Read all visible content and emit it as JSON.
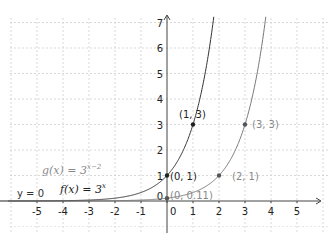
{
  "chart_data": {
    "type": "line",
    "title": "",
    "xlabel": "",
    "ylabel": "",
    "xlim": [
      -6,
      6
    ],
    "ylim": [
      -0.9,
      7.3
    ],
    "grid": true,
    "x_ticks": [
      -5,
      -4,
      -3,
      -2,
      -1,
      0,
      1,
      2,
      3,
      4,
      5
    ],
    "y_ticks": [
      0,
      1,
      2,
      3,
      4,
      5,
      6,
      7
    ],
    "series": [
      {
        "name": "f(x) = 3^x",
        "formula": "3^x",
        "color": "#333333",
        "points": [
          {
            "label": "(0, 1)",
            "x": 0,
            "y": 1
          },
          {
            "label": "(1, 3)",
            "x": 1,
            "y": 3
          }
        ]
      },
      {
        "name": "g(x) = 3^(x-2)",
        "formula": "3^(x-2)",
        "color": "#777777",
        "points": [
          {
            "label": "(0, 0.11)",
            "x": 0,
            "y": 0.11
          },
          {
            "label": "(2, 1)",
            "x": 2,
            "y": 1
          },
          {
            "label": "(3, 3)",
            "x": 3,
            "y": 3
          }
        ]
      }
    ],
    "asymptote": {
      "label": "y = 0",
      "y": 0
    },
    "legend": [
      {
        "text_main": "g(x)  =  3",
        "text_exp": "x−2",
        "color": "#888888"
      },
      {
        "text_main": "f(x)  =  3",
        "text_exp": "x",
        "color": "#333333"
      }
    ]
  },
  "labels": {
    "asymptote": "y = 0",
    "p_f0": "(0, 1)",
    "p_f1": "(1, 3)",
    "p_g0": "(0, 0.11)",
    "p_g2": "(2, 1)",
    "p_g3": "(3, 3)",
    "g_main": "g(x)  =  3",
    "g_exp": "x−2",
    "f_main": "f(x)  =  3",
    "f_exp": "x"
  }
}
